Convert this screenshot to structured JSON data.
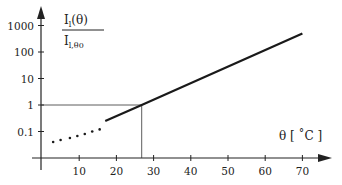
{
  "chart_data": {
    "type": "line",
    "title": "",
    "xlabel": "θ [ °C ]",
    "ylabel_numerator": "I_l(θ)",
    "ylabel_denominator": "I_l,θ0",
    "yscale": "log",
    "xlim": [
      0,
      75
    ],
    "ylim": [
      0.03,
      1000
    ],
    "x_ticks": [
      10,
      20,
      30,
      40,
      50,
      60,
      70
    ],
    "x_tick_labels": [
      "10",
      "20",
      "30",
      "40",
      "50",
      "60",
      "70"
    ],
    "y_ticks": [
      0.1,
      1,
      10,
      100,
      1000
    ],
    "y_tick_labels": [
      "0.1",
      "1",
      "10",
      "100",
      "1000"
    ],
    "grid": false,
    "legend": null,
    "series": [
      {
        "name": "measured (solid)",
        "style": "solid",
        "x": [
          17,
          26.8,
          70
        ],
        "values": [
          0.25,
          1,
          500
        ]
      },
      {
        "name": "extrapolated (dotted)",
        "style": "dotted",
        "x": [
          3,
          5,
          7.5,
          9.5,
          11.5,
          13.5,
          15.5
        ],
        "values": [
          0.04,
          0.048,
          0.057,
          0.068,
          0.08,
          0.1,
          0.12
        ]
      }
    ],
    "annotations": [
      {
        "type": "reference-lines",
        "x": 26.8,
        "y": 1,
        "description": "thin lines from y=1 on the axis to the curve and down to the x-axis"
      }
    ]
  },
  "labels": {
    "y_num_main": "I",
    "y_num_sub": "l",
    "y_num_rest": "(θ)",
    "y_den_main": "I",
    "y_den_sub": "l,θ0",
    "x_axis_title": "θ  [ ˚C ]"
  }
}
